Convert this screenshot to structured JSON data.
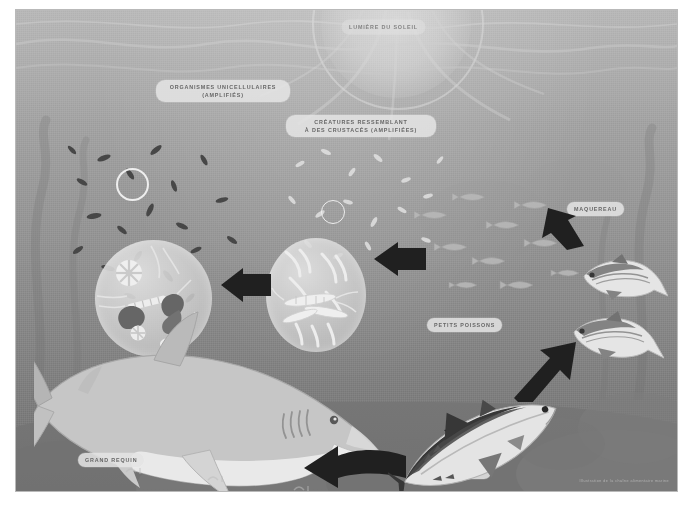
{
  "figure": {
    "title_alt": "Chaîne alimentaire marine",
    "labels": {
      "sunlight": "LUMIÈRE DU SOLEIL",
      "unicellular": "ORGANISMES UNICELLULAIRES\n(AMPLIFIÉS)",
      "crustaceans": "CRÉATURES RESSEMBLANT\nÀ DES CRUSTACÉS (AMPLIFIÉES)",
      "mackerel": "MAQUEREAU",
      "small_fish": "PETITS POISSONS",
      "big_shark": "GRAND REQUIN",
      "tuna": "THON"
    },
    "credit": "Illustration de la chaîne alimentaire marine",
    "colors": {
      "water_top": "#adb2ae",
      "water_mid": "#9aa09c",
      "water_low": "#7e847f",
      "seabed": "#6e7470",
      "label_bg": "#e7e9e6",
      "label_text": "#5d635f",
      "arrow": "#14181a",
      "bubble": "#ced2ce",
      "highlight": "#f1f3f0"
    }
  },
  "chain": {
    "steps": [
      {
        "order": 1,
        "name": "ORGANISMES UNICELLULAIRES"
      },
      {
        "order": 2,
        "name": "CRÉATURES RESSEMBLANT À DES CRUSTACÉS"
      },
      {
        "order": 3,
        "name": "PETITS POISSONS"
      },
      {
        "order": 4,
        "name": "MAQUEREAU"
      },
      {
        "order": 5,
        "name": "THON"
      },
      {
        "order": 6,
        "name": "GRAND REQUIN"
      }
    ]
  }
}
